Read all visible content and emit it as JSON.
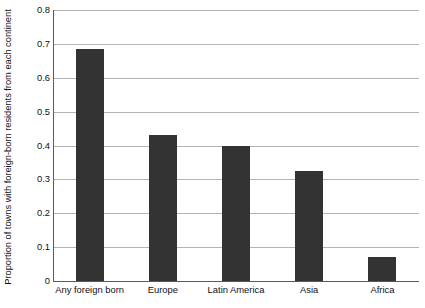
{
  "chart_data": {
    "type": "bar",
    "title": "",
    "xlabel": "",
    "ylabel": "Proportion of towns with foreign-born residents from each continent",
    "categories": [
      "Any foreign born",
      "Europe",
      "Latin America",
      "Asia",
      "Africa"
    ],
    "values": [
      0.685,
      0.43,
      0.4,
      0.325,
      0.07
    ],
    "ylim": [
      0,
      0.8
    ],
    "ytick_labels": [
      "0",
      "0.1",
      "0.2",
      "0.3",
      "0.4",
      "0.5",
      "0.6",
      "0.7",
      "0.8"
    ],
    "ytick_values": [
      0,
      0.1,
      0.2,
      0.3,
      0.4,
      0.5,
      0.6,
      0.7,
      0.8
    ],
    "grid": true,
    "legend": false,
    "legend_position": "none",
    "bar_color": "#333333",
    "gridline_color": "#b3b3b3",
    "axis_color": "#5a5a5a",
    "background_color": "#ffffff"
  }
}
